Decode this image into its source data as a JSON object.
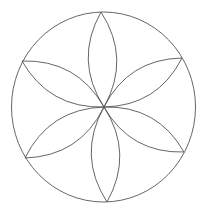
{
  "diagram": {
    "title": "",
    "type": "six-petal rosette (flower of life motif)",
    "background": "#ffffff",
    "stroke": "#555555",
    "outer_circle": {
      "cx": 103.5,
      "cy": 107,
      "rx": 92,
      "ry": 95
    },
    "center": {
      "x": 104,
      "y": 107
    },
    "petal_tips": [
      {
        "x": 101,
        "y": 12
      },
      {
        "x": 182,
        "y": 58
      },
      {
        "x": 184,
        "y": 152
      },
      {
        "x": 107,
        "y": 202
      },
      {
        "x": 25,
        "y": 158
      },
      {
        "x": 22,
        "y": 61
      }
    ]
  }
}
